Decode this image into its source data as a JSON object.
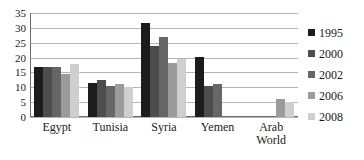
{
  "chart_data": {
    "type": "bar",
    "title": "",
    "xlabel": "",
    "ylabel": "",
    "ylim": [
      0,
      35
    ],
    "ytick_step": 5,
    "yticks": [
      "35",
      "30",
      "25",
      "20",
      "15",
      "10",
      "5",
      "0"
    ],
    "grid": true,
    "legend_position": "right",
    "categories": [
      "Egypt",
      "Tunisia",
      "Syria",
      "Yemen",
      "Arab World"
    ],
    "categories_wrapped": [
      [
        "Egypt"
      ],
      [
        "Tunisia"
      ],
      [
        "Syria"
      ],
      [
        "Yemen"
      ],
      [
        "Arab",
        "World"
      ]
    ],
    "series": [
      {
        "name": "1995",
        "color": "#1c1c1c",
        "values": [
          17,
          11.6,
          31.8,
          20.1,
          null
        ]
      },
      {
        "name": "2000",
        "color": "#4d4d4d",
        "values": [
          17,
          12.5,
          24,
          10.4,
          null
        ]
      },
      {
        "name": "2002",
        "color": "#666666",
        "values": [
          16.8,
          10.5,
          27,
          11,
          null
        ]
      },
      {
        "name": "2006",
        "color": "#9b9b9b",
        "values": [
          14.4,
          11.1,
          18.2,
          null,
          6.1
        ]
      },
      {
        "name": "2008",
        "color": "#cfcfcf",
        "values": [
          18,
          10,
          19.6,
          null,
          4.9
        ]
      }
    ]
  },
  "legend": {
    "items": [
      {
        "label": "1995",
        "color": "#1c1c1c"
      },
      {
        "label": "2000",
        "color": "#4d4d4d"
      },
      {
        "label": "2002",
        "color": "#666666"
      },
      {
        "label": "2006",
        "color": "#9b9b9b"
      },
      {
        "label": "2008",
        "color": "#cfcfcf"
      }
    ]
  }
}
